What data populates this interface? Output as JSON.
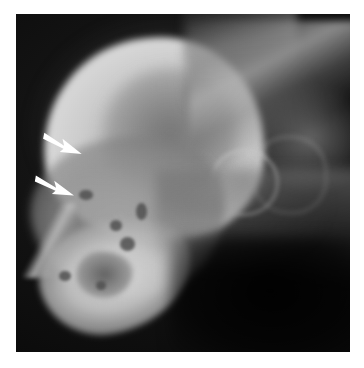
{
  "figure": {
    "domain": "Natural-Image",
    "modality": "radiograph",
    "view": "lateral",
    "subject": "skull",
    "caption": "Lateral radiograph of the skull showing the cranial vault, facial bones and mandible; two white arrows indicate a lesion along the rostrodorsal cortical margin.",
    "background_color": "#ffffff",
    "film_color": "#050505",
    "bone_color": "#d4d4d4",
    "arrow_color": "#ffffff"
  },
  "plate": {
    "label": "radiograph-plate",
    "x": 16,
    "y": 14,
    "width": 334,
    "height": 338
  },
  "annotations": {
    "arrows": [
      {
        "id": "arrow-upper",
        "label": "arrow-marker-1",
        "direction": "right-down",
        "x": 26,
        "y": 120,
        "width": 42,
        "height": 24,
        "rotation": 12,
        "color": "#ffffff"
      },
      {
        "id": "arrow-lower",
        "label": "arrow-marker-2",
        "direction": "right-down",
        "x": 18,
        "y": 162,
        "width": 42,
        "height": 24,
        "rotation": 10,
        "color": "#ffffff"
      }
    ]
  },
  "anatomy": [
    {
      "id": "cranial-dome",
      "label": "cranial vault",
      "radiodensity": "high"
    },
    {
      "id": "brain-case-lucency",
      "label": "intracranial lucency",
      "radiodensity": "low"
    },
    {
      "id": "facial-mass",
      "label": "facial / maxillary region",
      "radiodensity": "medium"
    },
    {
      "id": "mandible-bright",
      "label": "mandible / rostral bone",
      "radiodensity": "high"
    },
    {
      "id": "lytic-cavity",
      "label": "lytic cavity",
      "radiodensity": "low"
    },
    {
      "id": "rostral-tip",
      "label": "rostral bone tip",
      "radiodensity": "high"
    },
    {
      "id": "cervical-spine",
      "label": "occipital / cervical column",
      "radiodensity": "medium"
    },
    {
      "id": "ear-streak",
      "label": "pinna soft tissue",
      "radiodensity": "low"
    },
    {
      "id": "bulla-ring",
      "label": "tympanic bulla",
      "radiodensity": "medium"
    },
    {
      "id": "neck-band",
      "label": "ventral neck soft tissue",
      "radiodensity": "low"
    },
    {
      "id": "throat-shadow",
      "label": "pharyngeal air / throat",
      "radiodensity": "very low"
    }
  ]
}
